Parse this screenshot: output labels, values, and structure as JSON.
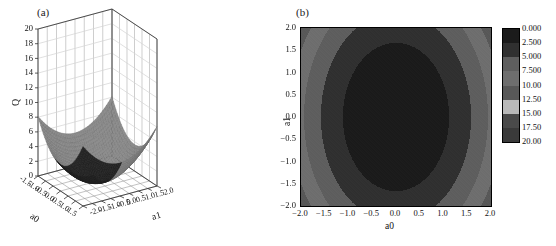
{
  "figure": {
    "panel_a_label": "(a)",
    "panel_b_label": "(b)"
  },
  "chart_data": [
    {
      "type": "surface",
      "panel": "(a)",
      "title": "",
      "xlabel": "a0",
      "ylabel": "a1",
      "zlabel": "Q",
      "xlim": [
        -1.5,
        1.5
      ],
      "ylim": [
        -2.0,
        2.0
      ],
      "zlim": [
        0,
        20
      ],
      "xticks": [
        "-1.5",
        "-1.0",
        "-0.5",
        "0.0",
        "0.5",
        "1.0",
        "1.5"
      ],
      "yticks": [
        "-2.0",
        "-1.5",
        "-1.0",
        "-0.5",
        "0.0",
        "0.5",
        "1.0",
        "1.5",
        "2.0"
      ],
      "zticks": [
        "0",
        "2",
        "4",
        "6",
        "8",
        "10",
        "12",
        "14",
        "16",
        "18",
        "20"
      ],
      "function": "Q = 2*a0^2 + 0.9*a1^2",
      "description": "Elliptic paraboloid bowl with minimum Q=0 near a0=0, a1=0; rises to about 13 at the -a0 corner and about 13 at the +a0 corner.",
      "grid": true,
      "mesh_color": "#7a7a7a",
      "shadow_color": "#262626"
    },
    {
      "type": "heatmap",
      "panel": "(b)",
      "title": "",
      "xlabel": "a0",
      "ylabel": "a1",
      "xlim": [
        -2.0,
        2.0
      ],
      "ylim": [
        -2.0,
        2.0
      ],
      "xticks": [
        "-2.0",
        "-1.5",
        "-1.0",
        "-0.5",
        "0.0",
        "0.5",
        "1.0",
        "1.5",
        "2.0"
      ],
      "yticks": [
        "-2.0",
        "-1.5",
        "-1.0",
        "-0.5",
        "0.0",
        "0.5",
        "1.0",
        "1.5",
        "2.0"
      ],
      "function": "Q = 2*a0^2 + 0.9*a1^2",
      "contour_levels": [
        0.0,
        2.5,
        5.0,
        7.5,
        10.0,
        12.5,
        15.0,
        17.5,
        20.0
      ],
      "zlim": [
        0,
        20
      ],
      "grid": false,
      "legend_position": "right",
      "colorbar": {
        "labels": [
          "0.000",
          "2.500",
          "5.000",
          "7.500",
          "10.00",
          "12.50",
          "15.00",
          "17.50",
          "20.00"
        ],
        "band_colors": [
          "#1b1b1b",
          "#303030",
          "#5e5e5e",
          "#6e6e6e",
          "#585858",
          "#b9b9b9",
          "#4a4a4a",
          "#3a3a3a"
        ]
      }
    }
  ]
}
